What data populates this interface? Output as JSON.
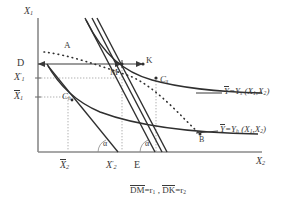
{
  "figure": {
    "type": "economics-isoquant-diagram",
    "axes": {
      "y_axis_label": "X",
      "y_axis_sub": "1",
      "x_axis_label": "X",
      "x_axis_sub": "2"
    },
    "y_ticks": [
      {
        "name": "D",
        "text": "D",
        "overbar": false,
        "prime": false,
        "sub": ""
      },
      {
        "name": "X-prime-1",
        "text": "X",
        "prime": true,
        "sub": "1",
        "overbar": false
      },
      {
        "name": "X-bar-1",
        "text": "X",
        "prime": false,
        "sub": "1",
        "overbar": true
      }
    ],
    "x_ticks": [
      {
        "name": "X-bar-2",
        "text": "X",
        "sub": "2",
        "overbar": true,
        "prime": false
      },
      {
        "name": "X-prime-2",
        "text": "X",
        "sub": "2",
        "overbar": false,
        "prime": true
      },
      {
        "name": "E",
        "text": "E",
        "sub": "",
        "overbar": false,
        "prime": false
      }
    ],
    "points": [
      {
        "name": "A",
        "label": "A",
        "sub": ""
      },
      {
        "name": "M",
        "label": "M",
        "sub": ""
      },
      {
        "name": "K",
        "label": "K",
        "sub": ""
      },
      {
        "name": "C-s",
        "label": "C",
        "sub": "s"
      },
      {
        "name": "C-h",
        "label": "C",
        "sub": "h"
      },
      {
        "name": "B",
        "label": "B",
        "sub": ""
      }
    ],
    "angles": [
      {
        "name": "alpha-left",
        "label": "α"
      },
      {
        "name": "alpha-right",
        "label": "α"
      }
    ],
    "curves": [
      {
        "name": "isoquant-s",
        "label_prefix": "Y",
        "label_eq": "=Y",
        "label_sub": "s",
        "label_args": "(X",
        "label_arg1_sub": "1",
        "label_comma": ",X",
        "label_arg2_sub": "2",
        "label_close": ")",
        "overbar_on_first_Y": true
      },
      {
        "name": "isoquant-h",
        "label_prefix": "Y",
        "label_eq": "=Y",
        "label_sub": "h",
        "label_args": "(X",
        "label_arg1_sub": "1",
        "label_comma": ",X",
        "label_arg2_sub": "2",
        "label_close": ")",
        "overbar_on_first_Y": true
      }
    ],
    "caption": {
      "name": "segment-legend",
      "seg1": "DM",
      "seg1_eq": "=r",
      "seg1_sub": "1",
      "separator": " , ",
      "seg2": "DK",
      "seg2_eq": "=r",
      "seg2_sub": "2"
    },
    "colors": {
      "ink": "#3a3a3a",
      "axis": "#6a6a6a",
      "guide": "#9a9a9a",
      "background": "#ffffff"
    }
  }
}
